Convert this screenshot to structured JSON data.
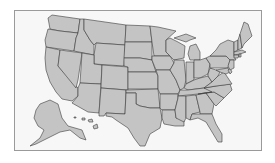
{
  "map": {
    "title": "",
    "subject": "United States state outline map",
    "colors": {
      "background": "#f7f7f7",
      "frame": "#9a9a9a",
      "state_fill": "#c4c4c4",
      "state_border": "#3a3a3a"
    },
    "regions": [
      {
        "id": "WA",
        "name": "Washington",
        "d": "M52,15 L80,19 L78,33 L60,31 L50,29 L48,18 Z"
      },
      {
        "id": "OR",
        "name": "Oregon",
        "d": "M48,29 L60,31 L78,33 L76,38 L74,51 L46,47 L45,40 Z"
      },
      {
        "id": "CA",
        "name": "California",
        "d": "M46,47 L60,50 L58,66 L78,88 L78,96 L72,101 L62,99 L56,92 L50,82 L46,70 L45,58 Z"
      },
      {
        "id": "ID",
        "name": "Idaho",
        "d": "M80,19 L84,19 L84,30 L90,40 L94,45 L94,55 L74,51 L76,38 L78,33 Z"
      },
      {
        "id": "NV",
        "name": "Nevada",
        "d": "M60,50 L82,53 L78,80 L76,88 L58,66 Z"
      },
      {
        "id": "MT",
        "name": "Montana",
        "d": "M84,19 L126,25 L125,45 L96,43 L94,45 L90,40 L84,30 Z"
      },
      {
        "id": "WY",
        "name": "Wyoming",
        "d": "M96,43 L125,45 L124,66 L94,64 L94,55 Z"
      },
      {
        "id": "UT",
        "name": "Utah",
        "d": "M82,53 L94,55 L94,64 L102,65 L101,84 L80,83 Z"
      },
      {
        "id": "AZ",
        "name": "Arizona",
        "d": "M80,83 L101,84 L99,113 L88,112 L72,103 L78,96 L78,88 Z"
      },
      {
        "id": "CO",
        "name": "Colorado",
        "d": "M102,65 L128,67 L128,90 L101,88 Z"
      },
      {
        "id": "NM",
        "name": "New Mexico",
        "d": "M101,88 L126,90 L125,114 L106,113 L104,116 L99,116 L99,113 Z"
      },
      {
        "id": "ND",
        "name": "North Dakota",
        "d": "M126,25 L150,26 L152,42 L125,42 Z"
      },
      {
        "id": "SD",
        "name": "South Dakota",
        "d": "M125,42 L152,42 L152,60 L140,58 L124,58 Z"
      },
      {
        "id": "NE",
        "name": "Nebraska",
        "d": "M124,58 L140,58 L152,60 L156,72 L128,72 L128,67 L124,66 Z"
      },
      {
        "id": "KS",
        "name": "Kansas",
        "d": "M128,72 L156,72 L158,76 L158,89 L128,89 Z"
      },
      {
        "id": "OK",
        "name": "Oklahoma",
        "d": "M126,90 L158,89 L160,108 L150,108 L140,106 L136,104 L136,93 L126,93 Z"
      },
      {
        "id": "TX",
        "name": "Texas",
        "d": "M126,93 L136,93 L136,104 L140,106 L150,108 L160,108 L162,118 L160,128 L150,134 L145,146 L140,146 L134,138 L128,128 L122,124 L116,120 L112,117 L106,116 L106,113 L125,114 Z"
      },
      {
        "id": "MN",
        "name": "Minnesota",
        "d": "M150,26 L158,27 L176,31 L166,40 L166,52 L170,56 L154,56 L152,42 Z"
      },
      {
        "id": "IA",
        "name": "Iowa",
        "d": "M152,56 L170,56 L174,63 L170,70 L156,70 L152,60 Z"
      },
      {
        "id": "MO",
        "name": "Missouri",
        "d": "M156,70 L170,70 L176,80 L180,90 L178,94 L160,94 L158,89 L158,76 Z"
      },
      {
        "id": "AR",
        "name": "Arkansas",
        "d": "M160,94 L178,94 L178,98 L175,110 L162,110 L160,108 Z"
      },
      {
        "id": "LA",
        "name": "Louisiana",
        "d": "M162,110 L175,110 L176,118 L184,118 L184,126 L175,126 L164,124 L162,118 Z"
      },
      {
        "id": "WI",
        "name": "Wisconsin",
        "d": "M166,40 L170,38 L178,42 L185,46 L184,58 L174,60 L170,56 L166,52 Z"
      },
      {
        "id": "IL",
        "name": "Illinois",
        "d": "M174,60 L184,60 L186,80 L184,88 L180,90 L176,80 L170,70 L174,63 Z"
      },
      {
        "id": "MI",
        "name": "Michigan",
        "d": "M174,38 L186,34 L196,38 L190,40 L186,42 Z M190,46 L196,44 L200,52 L200,60 L190,60 L188,54 Z"
      },
      {
        "id": "IN",
        "name": "Indiana",
        "d": "M186,62 L194,62 L194,80 L186,84 Z"
      },
      {
        "id": "OH",
        "name": "Ohio",
        "d": "M194,60 L200,60 L206,58 L210,64 L208,74 L200,78 L194,78 Z"
      },
      {
        "id": "KY",
        "name": "Kentucky",
        "d": "M184,88 L186,84 L194,80 L200,78 L208,76 L212,82 L204,88 L188,90 Z"
      },
      {
        "id": "TN",
        "name": "Tennessee",
        "d": "M180,90 L188,90 L204,88 L216,86 L212,92 L198,94 L178,96 Z"
      },
      {
        "id": "MS",
        "name": "Mississippi",
        "d": "M178,96 L186,96 L186,118 L184,122 L176,118 L175,110 L178,98 Z"
      },
      {
        "id": "AL",
        "name": "Alabama",
        "d": "M186,96 L196,95 L200,112 L192,114 L190,120 L186,118 Z"
      },
      {
        "id": "GA",
        "name": "Georgia",
        "d": "M196,95 L206,93 L214,104 L212,114 L200,114 L200,112 Z"
      },
      {
        "id": "FL",
        "name": "Florida",
        "d": "M190,120 L192,114 L200,114 L212,114 L216,124 L222,134 L222,142 L218,142 L212,132 L206,122 L198,118 Z"
      },
      {
        "id": "SC",
        "name": "South Carolina",
        "d": "M206,93 L214,92 L224,98 L216,106 L214,104 Z"
      },
      {
        "id": "NC",
        "name": "North Carolina",
        "d": "M204,88 L216,86 L230,84 L232,90 L224,98 L214,92 L206,93 L198,94 L212,92 Z"
      },
      {
        "id": "VA",
        "name": "Virginia",
        "d": "M204,88 L212,82 L218,76 L224,72 L228,78 L232,84 L216,86 Z"
      },
      {
        "id": "WV",
        "name": "West Virginia",
        "d": "M208,74 L210,68 L216,70 L220,72 L218,76 L212,82 L208,76 Z"
      },
      {
        "id": "PA",
        "name": "Pennsylvania",
        "d": "M206,58 L210,56 L226,56 L230,60 L228,68 L210,68 L210,64 Z"
      },
      {
        "id": "NY",
        "name": "New York",
        "d": "M210,56 L216,50 L220,44 L228,40 L234,42 L234,56 L236,60 L230,60 L226,56 Z"
      },
      {
        "id": "MD",
        "name": "Maryland",
        "d": "M216,70 L228,68 L230,72 L226,74 L220,72 Z"
      },
      {
        "id": "DE",
        "name": "Delaware",
        "d": "M230,68 L232,72 L230,74 L228,70 Z"
      },
      {
        "id": "NJ",
        "name": "New Jersey",
        "d": "M230,60 L234,60 L234,68 L230,70 L228,66 Z"
      },
      {
        "id": "VT",
        "name": "Vermont",
        "d": "M234,42 L238,40 L238,50 L234,52 Z"
      },
      {
        "id": "NH",
        "name": "New Hampshire",
        "d": "M238,40 L240,34 L242,48 L238,50 Z"
      },
      {
        "id": "ME",
        "name": "Maine",
        "d": "M240,34 L244,22 L248,24 L252,36 L244,44 L242,48 Z"
      },
      {
        "id": "MA",
        "name": "Massachusetts",
        "d": "M234,52 L242,50 L246,52 L240,54 L234,55 Z"
      },
      {
        "id": "CT",
        "name": "Connecticut",
        "d": "M234,55 L239,55 L238,58 L234,58 Z"
      },
      {
        "id": "RI",
        "name": "Rhode Island",
        "d": "M239,54 L241,54 L241,57 L239,57 Z"
      },
      {
        "id": "AK",
        "name": "Alaska",
        "d": "M40,104 L50,100 L58,104 L62,118 L68,126 L82,130 L86,140 L80,138 L70,130 L60,132 L48,138 L36,144 L30,146 L40,138 L44,130 L38,126 L34,118 L36,110 Z"
      },
      {
        "id": "HI",
        "name": "Hawaii",
        "d": "M74,117 L76,117 L76,118 L74,118 Z M82,118 L85,118 L85,120 L82,120 Z M88,120 L92,119 L93,122 L89,122 Z M93,126 L97,124 L98,128 L94,129 Z"
      }
    ]
  }
}
